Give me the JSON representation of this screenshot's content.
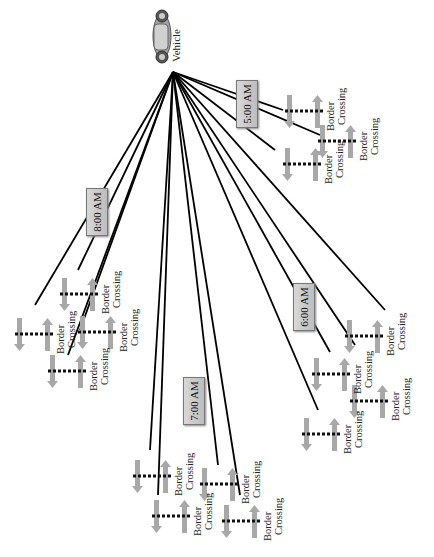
{
  "vehicle": {
    "label": "Vehicle",
    "icon": "car-icon"
  },
  "time_labels": [
    {
      "label": "5:00 AM",
      "x": 236,
      "y": 80
    },
    {
      "label": "8:00 AM",
      "x": 86,
      "y": 188
    },
    {
      "label": "6:00 AM",
      "x": 293,
      "y": 283
    },
    {
      "label": "7:00 AM",
      "x": 183,
      "y": 377
    }
  ],
  "border_crossing_label": "Border\nCrossing",
  "crossings": [
    {
      "id": "c1",
      "x": 285,
      "y": 95,
      "label_line1": "Border",
      "label_line2": "Crossing"
    },
    {
      "id": "c2",
      "x": 318,
      "y": 125,
      "label_line1": "Border",
      "label_line2": "Crossing"
    },
    {
      "id": "c3",
      "x": 283,
      "y": 148,
      "label_line1": "Border",
      "label_line2": "Crossing"
    },
    {
      "id": "c4",
      "x": 60,
      "y": 278,
      "label_line1": "Border",
      "label_line2": "Crossing"
    },
    {
      "id": "c5",
      "x": 15,
      "y": 318,
      "label_line1": "Border",
      "label_line2": "Crossing"
    },
    {
      "id": "c6",
      "x": 78,
      "y": 316,
      "label_line1": "Border",
      "label_line2": "Crossing"
    },
    {
      "id": "c7",
      "x": 48,
      "y": 355,
      "label_line1": "Border",
      "label_line2": "Crossing"
    },
    {
      "id": "c8",
      "x": 345,
      "y": 320,
      "label_line1": "Border",
      "label_line2": "Crossing"
    },
    {
      "id": "c9",
      "x": 312,
      "y": 358,
      "label_line1": "Border",
      "label_line2": "Crossing"
    },
    {
      "id": "c10",
      "x": 350,
      "y": 385,
      "label_line1": "Border",
      "label_line2": "Crossing"
    },
    {
      "id": "c11",
      "x": 302,
      "y": 418,
      "label_line1": "Border",
      "label_line2": "Crossing"
    },
    {
      "id": "c12",
      "x": 133,
      "y": 460,
      "label_line1": "Border",
      "label_line2": "Crossing"
    },
    {
      "id": "c13",
      "x": 200,
      "y": 468,
      "label_line1": "Border",
      "label_line2": "Crossing"
    },
    {
      "id": "c14",
      "x": 152,
      "y": 500,
      "label_line1": "Border",
      "label_line2": "Crossing"
    },
    {
      "id": "c15",
      "x": 222,
      "y": 505,
      "label_line1": "Border",
      "label_line2": "Crossing"
    }
  ],
  "lines": [
    [
      173,
      72,
      283,
      110
    ],
    [
      173,
      72,
      320,
      135
    ],
    [
      173,
      72,
      275,
      150
    ],
    [
      173,
      72,
      35,
      305
    ],
    [
      173,
      72,
      78,
      270
    ],
    [
      173,
      72,
      68,
      355
    ],
    [
      173,
      72,
      80,
      330
    ],
    [
      173,
      72,
      385,
      310
    ],
    [
      173,
      72,
      355,
      345
    ],
    [
      173,
      72,
      330,
      352
    ],
    [
      173,
      72,
      318,
      410
    ],
    [
      173,
      72,
      150,
      450
    ],
    [
      173,
      72,
      158,
      495
    ],
    [
      173,
      72,
      218,
      465
    ],
    [
      173,
      72,
      240,
      495
    ]
  ],
  "colors": {
    "line": "#000000",
    "box_fill": "#c8c8c8",
    "arrow": "#a8a8a8",
    "barrier": "#111111"
  }
}
